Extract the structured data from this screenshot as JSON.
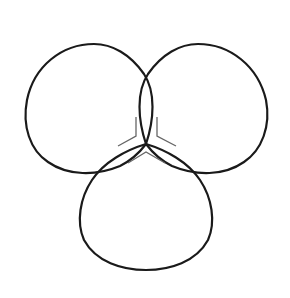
{
  "diagram": {
    "type": "trefoil-three-lobed-curve",
    "background": "#ffffff",
    "stroke_color": "#1a1a1a",
    "mark_color": "#666666",
    "lobes": [
      {
        "name": "left-lobe",
        "top": [
          95,
          44
        ],
        "leftmost": [
          26,
          125
        ],
        "bottom": [
          90,
          172
        ]
      },
      {
        "name": "right-lobe",
        "top": [
          196,
          44
        ],
        "rightmost": [
          268,
          120
        ],
        "bottom": [
          200,
          172
        ]
      },
      {
        "name": "bottom-lobe",
        "leftmost": [
          78,
          215
        ],
        "bottom": [
          145,
          268
        ],
        "rightmost": [
          215,
          215
        ]
      }
    ],
    "center_point": [
      146,
      144
    ],
    "crossings": [
      {
        "lobes": [
          "left-lobe",
          "right-lobe"
        ],
        "point": [
          147,
          90
        ]
      },
      {
        "lobes": [
          "left-lobe",
          "bottom-lobe"
        ],
        "point": [
          99,
          173
        ]
      },
      {
        "lobes": [
          "right-lobe",
          "bottom-lobe"
        ],
        "point": [
          196,
          171
        ]
      }
    ],
    "marks": [
      {
        "name": "upper-left-bracket",
        "points": [
          [
            136,
            117
          ],
          [
            136,
            136
          ],
          [
            118,
            146
          ]
        ]
      },
      {
        "name": "upper-right-bracket",
        "points": [
          [
            157,
            117
          ],
          [
            157,
            136
          ],
          [
            176,
            146
          ]
        ]
      },
      {
        "name": "lower-chevron",
        "points": [
          [
            128,
            163
          ],
          [
            146,
            152
          ],
          [
            165,
            163
          ]
        ]
      }
    ]
  }
}
